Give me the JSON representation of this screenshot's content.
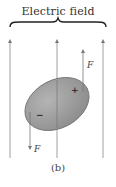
{
  "diagram": {
    "title": "Electric field",
    "caption": "(b)",
    "labels": {
      "force_top": "F",
      "force_bottom": "F",
      "plus_charge": "+",
      "minus_charge": "−"
    },
    "colors": {
      "field_lines": "#888888",
      "dipole_fill": "#9a9a9a",
      "dipole_edge": "#6e6e6e",
      "brace": "#222222"
    }
  }
}
